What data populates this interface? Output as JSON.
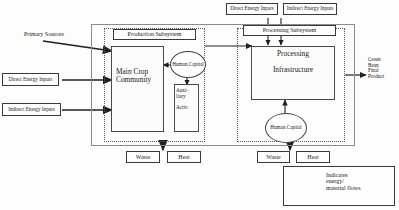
{
  "diagram": {
    "title_labels": {
      "primary_sources": "Primary Sources",
      "production_subsystem": "Production Subsystem",
      "processing_subsystem": "Processing Subsystem"
    },
    "top_inputs": [
      {
        "label": "Direct Energy Inputs"
      },
      {
        "label": "Indirect Energy Inputs"
      }
    ],
    "left_inputs": [
      {
        "label": "Direct Energy Inputs"
      },
      {
        "label": "Indirect Energy Inputs"
      }
    ],
    "production": {
      "main_box": "Main Crop\nCommunity",
      "human_capital": "Human\nCapital",
      "auxiliary": "Auxi-\nliary\n\nActiv"
    },
    "processing": {
      "infrastructure": "Processing\n\nInfrastructure",
      "human_capital": "Human\nCapital"
    },
    "outputs": {
      "production_waste": "Waste",
      "production_heat": "Heat",
      "processing_waste": "Waste",
      "processing_heat": "Heat",
      "final_product": "Green\nBean\nFinal\nProduct"
    },
    "legend": {
      "text": "Indicates\nenergy/\nmaterial flows"
    },
    "colors": {
      "ink": "#1a1a1a",
      "line": "#3a3a3a",
      "frame": "#8b8b8b"
    }
  }
}
